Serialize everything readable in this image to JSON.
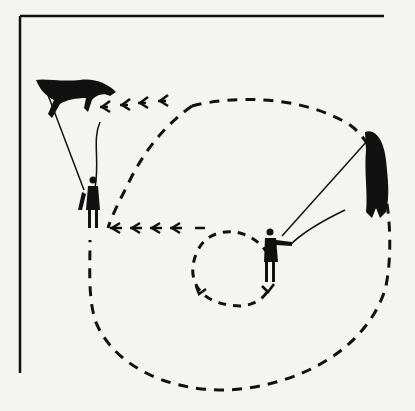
{
  "figure": {
    "colors": {
      "ink": "#111111",
      "paper": "#f4f4f2",
      "bleed_through": "#e6e6e2"
    },
    "elements": [
      {
        "name": "horse-top-left",
        "label": "Horse rearing on lunge line"
      },
      {
        "name": "handler-left",
        "label": "Handler holding lunge line"
      },
      {
        "name": "horse-right",
        "label": "Horse on circle"
      },
      {
        "name": "handler-center",
        "label": "Handler with whip at circle center"
      },
      {
        "name": "outer-circle-path",
        "label": "Dashed outer circle path"
      },
      {
        "name": "inner-circle-path",
        "label": "Dashed inner small circle path"
      },
      {
        "name": "arrow-top",
        "label": "Arrows pointing left toward top-left horse"
      },
      {
        "name": "arrow-middle",
        "label": "Arrows pointing left toward left handler"
      }
    ]
  }
}
